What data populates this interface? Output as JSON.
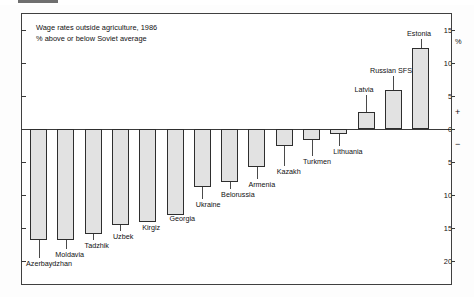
{
  "figure": {
    "title_line1": "Wage rates outside agriculture, 1986",
    "title_line2": "% above or below Soviet average",
    "unit_symbol": "%",
    "plus_symbol": "+",
    "minus_symbol": "−"
  },
  "chart_data": {
    "type": "bar",
    "title": "Wage rates outside agriculture, 1986",
    "subtitle": "% above or below Soviet average",
    "xlabel": "",
    "ylabel": "%",
    "ylim": [
      -20,
      15
    ],
    "grid": false,
    "legend": "none",
    "orientation": "vertical",
    "axis_position": "right",
    "yticks": [
      15,
      10,
      5,
      0,
      -5,
      -10,
      -15,
      -20
    ],
    "ytick_labels": [
      "15",
      "10",
      "5",
      "0",
      "5",
      "10",
      "15",
      "20"
    ],
    "sign_markers": [
      "+",
      "−"
    ],
    "categories": [
      "Azerbaydzhan",
      "Moldavia",
      "Tadzhik",
      "Uzbek",
      "Kirgiz",
      "Georgia",
      "Ukraine",
      "Belorussia",
      "Armenia",
      "Kazakh",
      "Turkmen",
      "Lithuania",
      "Latvia",
      "Russian SFSR",
      "Estonia"
    ],
    "values": [
      -16.8,
      -16.8,
      -16.0,
      -14.6,
      -14.2,
      -13.0,
      -8.8,
      -8.0,
      -5.8,
      -2.6,
      -1.6,
      -0.7,
      2.6,
      6.0,
      12.3
    ]
  }
}
